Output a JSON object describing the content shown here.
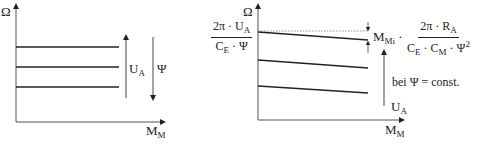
{
  "left_diagram": {
    "y_axis_label": "Ω",
    "x_axis_label_main": "M",
    "x_axis_label_sub": "M",
    "arrow_ua_label_main": "U",
    "arrow_ua_label_sub": "A",
    "arrow_psi_label": "Ψ",
    "curves": [
      {
        "y": 47,
        "slope": "horizontal"
      },
      {
        "y": 67,
        "slope": "horizontal"
      },
      {
        "y": 87,
        "slope": "horizontal"
      }
    ]
  },
  "right_diagram": {
    "y_axis_label": "Ω",
    "x_axis_label_main": "M",
    "x_axis_label_sub": "M",
    "intercept_fraction": {
      "num_pre": "2π · U",
      "num_sub": "A",
      "den_pre": "C",
      "den_sub": "E",
      "den_post": " · Ψ"
    },
    "drop_label": {
      "m_main": "M",
      "m_sub": "Mi",
      "dot": " · ",
      "num_pre": "2π · R",
      "num_sub": "A",
      "den_c1": "C",
      "den_c1_sub": "E",
      "den_mid": " · C",
      "den_c2_sub": "M",
      "den_psi": " · Ψ",
      "den_exp": "2"
    },
    "condition_label": "bei Ψ = const.",
    "arrow_ua_label_main": "U",
    "arrow_ua_label_sub": "A",
    "curves": [
      {
        "x1": 258,
        "y1": 32,
        "x2": 368,
        "y2": 40
      },
      {
        "x1": 258,
        "y1": 60,
        "x2": 368,
        "y2": 68
      },
      {
        "x1": 258,
        "y1": 86,
        "x2": 368,
        "y2": 93
      }
    ]
  }
}
